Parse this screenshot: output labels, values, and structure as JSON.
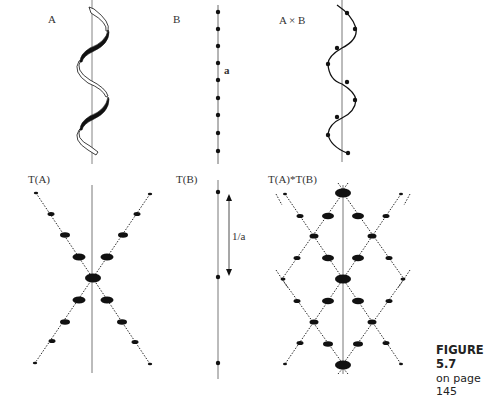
{
  "panels": {
    "a": {
      "label": "A"
    },
    "b": {
      "label": "B",
      "spacing_label": "a"
    },
    "axb": {
      "label": "A × B"
    },
    "ta": {
      "label": "T(A)"
    },
    "tb": {
      "label": "T(B)",
      "spacing_label": "1/a"
    },
    "tatb": {
      "label": "T(A)*T(B)"
    }
  },
  "caption": {
    "figure": "FIGURE 5.7",
    "page": "on page 145"
  },
  "colors": {
    "ink": "#111111",
    "axis": "#555555",
    "background": "#ffffff"
  }
}
